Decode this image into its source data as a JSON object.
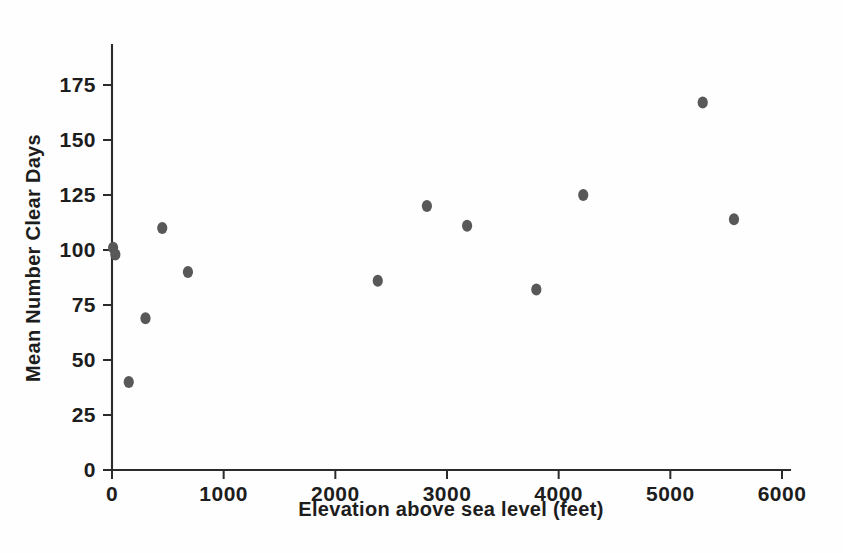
{
  "chart_data": {
    "type": "scatter",
    "title": "",
    "xlabel": "Elevation above sea level (feet)",
    "ylabel": "Mean Number Clear Days",
    "xlim": [
      0,
      6100
    ],
    "ylim": [
      0,
      188
    ],
    "xticks": [
      0,
      1000,
      2000,
      3000,
      4000,
      5000,
      6000
    ],
    "xtick_labels": [
      "0",
      "1000",
      "2000",
      "3000",
      "4000",
      "5000",
      "6000"
    ],
    "yticks": [
      0,
      25,
      50,
      75,
      100,
      125,
      150,
      175
    ],
    "ytick_labels": [
      "0",
      "25",
      "50",
      "75",
      "100",
      "125",
      "150",
      "175"
    ],
    "grid": false,
    "legend": null,
    "marker_color": "#585858",
    "marker_size": 9,
    "axis_color": "#2b2b2b",
    "background_color": "#fefefe",
    "x": [
      10,
      30,
      150,
      300,
      450,
      680,
      2380,
      2820,
      3180,
      3800,
      4220,
      5290,
      5570
    ],
    "y": [
      101,
      98,
      40,
      69,
      110,
      90,
      86,
      120,
      111,
      82,
      125,
      167,
      114
    ],
    "points": [
      {
        "x": 10,
        "y": 101
      },
      {
        "x": 30,
        "y": 98
      },
      {
        "x": 150,
        "y": 40
      },
      {
        "x": 300,
        "y": 69
      },
      {
        "x": 450,
        "y": 110
      },
      {
        "x": 680,
        "y": 90
      },
      {
        "x": 2380,
        "y": 86
      },
      {
        "x": 2820,
        "y": 120
      },
      {
        "x": 3180,
        "y": 111
      },
      {
        "x": 3800,
        "y": 82
      },
      {
        "x": 4220,
        "y": 125
      },
      {
        "x": 5290,
        "y": 167
      },
      {
        "x": 5570,
        "y": 114
      }
    ]
  },
  "axes": {
    "x_title": "Elevation above sea level (feet)",
    "y_title": "Mean Number Clear Days"
  }
}
